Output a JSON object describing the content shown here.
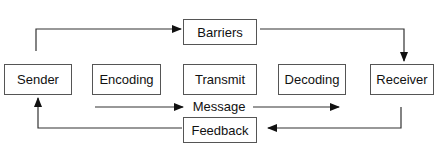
{
  "diagram": {
    "nodes": {
      "barriers": "Barriers",
      "sender": "Sender",
      "encoding": "Encoding",
      "transmit": "Transmit",
      "decoding": "Decoding",
      "receiver": "Receiver",
      "feedback": "Feedback"
    },
    "edge_labels": {
      "message": "Message"
    },
    "edges": [
      {
        "from": "sender",
        "to": "barriers"
      },
      {
        "from": "barriers",
        "to": "receiver"
      },
      {
        "from": "encoding",
        "to": "decoding",
        "label": "Message"
      },
      {
        "from": "receiver",
        "to": "feedback"
      },
      {
        "from": "feedback",
        "to": "sender"
      }
    ],
    "colors": {
      "line": "#333333",
      "box_border": "#555555",
      "text": "#111111",
      "background": "#ffffff"
    }
  }
}
